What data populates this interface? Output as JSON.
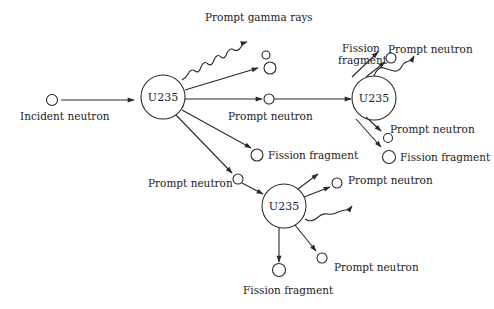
{
  "diagram": {
    "type": "nuclear fission chain reaction",
    "nodes": {
      "nucleus_main": {
        "label": "U235"
      },
      "nucleus_upper_right": {
        "label": "U235"
      },
      "nucleus_lower": {
        "label": "U235"
      }
    },
    "labels": {
      "incident_neutron": "Incident neutron",
      "prompt_gamma_rays": "Prompt gamma rays",
      "prompt_neutron_main": "Prompt neutron",
      "fission_fragment_main": "Fission fragment",
      "prompt_neutron_lower_in": "Prompt neutron",
      "fission_fragment_ur_line1": "Fission",
      "fission_fragment_ur_line2": "fragment",
      "prompt_neutron_ur_top": "Prompt neutron",
      "prompt_neutron_ur_bottom": "Prompt neutron",
      "fission_fragment_ur_bottom": "Fission fragment",
      "prompt_neutron_lower_top": "Prompt neutron",
      "prompt_neutron_lower_bottom": "Prompt neutron",
      "fission_fragment_lower_bottom": "Fission fragment"
    },
    "colors": {
      "stroke": "#2a2a2a",
      "text": "#222222",
      "background": "#ffffff"
    }
  }
}
